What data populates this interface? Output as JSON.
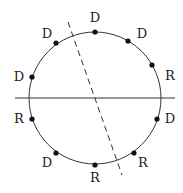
{
  "diagram": {
    "circle": {
      "cx": 95,
      "cy": 98,
      "r": 66,
      "stroke": "#333333"
    },
    "solid_line": {
      "x1": 15,
      "y1": 98,
      "x2": 175,
      "y2": 98
    },
    "dashed_line": {
      "x1": 68,
      "y1": 22,
      "x2": 122,
      "y2": 175
    },
    "points": [
      {
        "angle_deg": 0,
        "label": "D"
      },
      {
        "angle_deg": 30,
        "label": "D"
      },
      {
        "angle_deg": 60,
        "label": "R"
      },
      {
        "angle_deg": 120,
        "label": "D"
      },
      {
        "angle_deg": 150,
        "label": "R"
      },
      {
        "angle_deg": 180,
        "label": "R"
      },
      {
        "angle_deg": 210,
        "label": "D"
      },
      {
        "angle_deg": 240,
        "label": "R"
      },
      {
        "angle_deg": 300,
        "label": "D"
      },
      {
        "angle_deg": 330,
        "label": "D"
      }
    ]
  },
  "labels": {
    "p0": "D",
    "p1": "D",
    "p2": "R",
    "p3": "D",
    "p4": "R",
    "p5": "R",
    "p6": "D",
    "p7": "R",
    "p8": "D",
    "p9": "D"
  }
}
